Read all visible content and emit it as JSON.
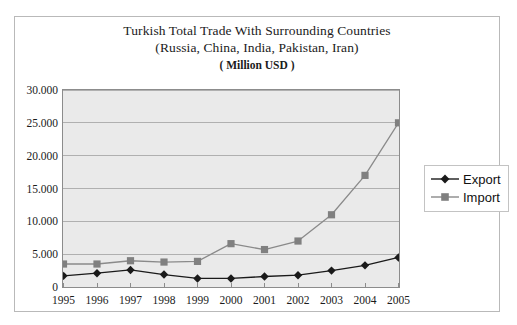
{
  "chart_data": {
    "type": "line",
    "title": "Turkish Total Trade With Surrounding Countries",
    "title_line2": "(Russia, China, India, Pakistan, Iran)",
    "subtitle": "( Million USD )",
    "xlabel": "",
    "ylabel": "",
    "categories": [
      "1995",
      "1996",
      "1997",
      "1998",
      "1999",
      "2000",
      "2001",
      "2002",
      "2003",
      "2004",
      "2005"
    ],
    "x": [
      1995,
      1996,
      1997,
      1998,
      1999,
      2000,
      2001,
      2002,
      2003,
      2004,
      2005
    ],
    "ylim": [
      0,
      30000
    ],
    "yticks": [
      0,
      5000,
      10000,
      15000,
      20000,
      25000,
      30000
    ],
    "ytick_labels": [
      "0",
      "5.000",
      "10.000",
      "15.000",
      "20.000",
      "25.000",
      "30.000"
    ],
    "grid": true,
    "grid_axis": "y",
    "legend_position": "right",
    "series": [
      {
        "name": "Export",
        "marker": "diamond",
        "color": "#1a1a1a",
        "values": [
          1700,
          2100,
          2600,
          1900,
          1300,
          1300,
          1600,
          1800,
          2500,
          3300,
          4500
        ]
      },
      {
        "name": "Import",
        "marker": "square",
        "color": "#808080",
        "values": [
          3500,
          3500,
          4000,
          3800,
          3900,
          6600,
          5700,
          7000,
          11000,
          17000,
          25000
        ]
      }
    ]
  },
  "legend": {
    "items": [
      {
        "label": "Export"
      },
      {
        "label": "Import"
      }
    ]
  }
}
